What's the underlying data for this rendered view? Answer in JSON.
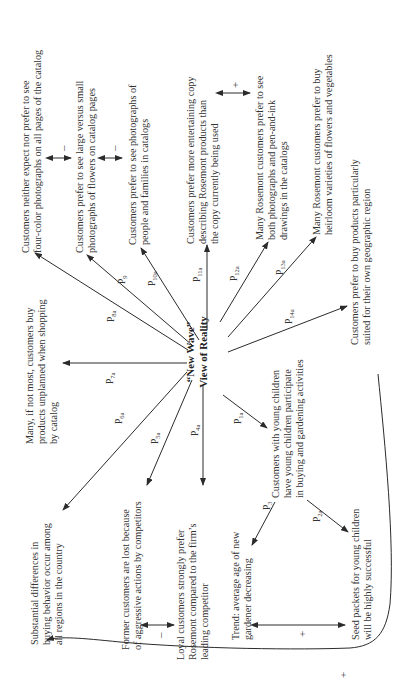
{
  "diagram": {
    "center": {
      "line1": "“New Wave”",
      "line2": "View of Reality"
    },
    "nodes": [
      {
        "id": "four-color",
        "lines": [
          "Customers neither expect nor prefer to see",
          "four-color photographs on all pages of the catalog"
        ]
      },
      {
        "id": "large-photos",
        "lines": [
          "Customers  prefer to see large versus small",
          "photographs of flowers on catalog pages"
        ]
      },
      {
        "id": "people-photos",
        "lines": [
          "Customers prefer to see photographs of",
          "people  and families in catalogs"
        ]
      },
      {
        "id": "entertaining-copy",
        "lines": [
          "Customers prefer more entertaining copy",
          "describing Rosemont products than",
          "the copy currently being used"
        ]
      },
      {
        "id": "pen-and-ink",
        "lines": [
          "Many Rosemont customers prefer to see",
          "both photographs and pen-and-ink",
          "drawings in the catalogs"
        ]
      },
      {
        "id": "heirloom",
        "lines": [
          "Many Rosemont customers prefer to buy",
          "heirloom varieties of flowers and vegetables"
        ]
      },
      {
        "id": "geographic",
        "lines": [
          "Customers prefer to buy products particularly",
          "suited  for their own geographic region"
        ]
      },
      {
        "id": "unplanned",
        "lines": [
          "Many, if not most, customers buy",
          "products unplanned when shopping",
          "by catalog"
        ]
      },
      {
        "id": "regional-differences",
        "lines": [
          "Substantial differences in",
          "buying behavior occur among",
          "all  regions in the country"
        ]
      },
      {
        "id": "former-customers",
        "lines": [
          "Former customers are lost because",
          "of aggressive actions by competitors"
        ]
      },
      {
        "id": "loyal-customers",
        "lines": [
          "Loyal customers strongly prefer",
          "Rosemont compared to the firm’s",
          "leading  competitor"
        ]
      },
      {
        "id": "young-children",
        "lines": [
          "Customers with young children",
          "have young children participate",
          "in buying and gardening activities"
        ]
      },
      {
        "id": "trend-age",
        "lines": [
          "Trend: average age of new",
          "gardener decreasing"
        ]
      },
      {
        "id": "seed-packets",
        "lines": [
          "Seed packets for young children",
          "will be highly successful"
        ]
      }
    ],
    "propositions": [
      {
        "label": "P",
        "sub": "1a"
      },
      {
        "label": "P",
        "sub": "2a"
      },
      {
        "label": "P",
        "sub": "3"
      },
      {
        "label": "P",
        "sub": "4a"
      },
      {
        "label": "P",
        "sub": "5a"
      },
      {
        "label": "P",
        "sub": "6a"
      },
      {
        "label": "P",
        "sub": "7a"
      },
      {
        "label": "P",
        "sub": "8a"
      },
      {
        "label": "P",
        "sub": "9"
      },
      {
        "label": "P",
        "sub": "10a"
      },
      {
        "label": "P",
        "sub": "11a"
      },
      {
        "label": "P",
        "sub": "12a"
      },
      {
        "label": "P",
        "sub": "13a"
      },
      {
        "label": "P",
        "sub": "14a"
      }
    ],
    "relations": {
      "four_color_large": "–",
      "large_people": "–",
      "copy_penink": "+",
      "former_loyal": "–",
      "trend_seed": "+",
      "feedback_loop": "+"
    },
    "colors": {
      "line": "#2b2b2b",
      "text": "#333333",
      "background": "#ffffff"
    }
  }
}
